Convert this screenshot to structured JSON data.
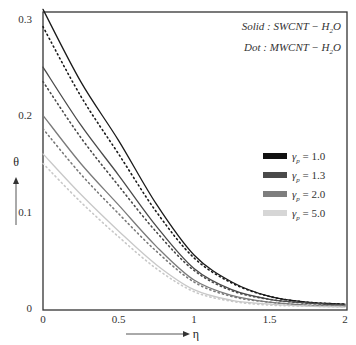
{
  "chart_data": {
    "type": "line",
    "title": "",
    "xlabel": "η",
    "ylabel": "θ",
    "xlim": [
      0,
      2
    ],
    "ylim": [
      0,
      0.31
    ],
    "xticks": [
      0,
      0.5,
      1,
      1.5,
      2
    ],
    "xtick_labels": [
      "0",
      "0.5",
      "1",
      "1.5",
      "2"
    ],
    "yticks": [
      0,
      0.1,
      0.2,
      0.3
    ],
    "ytick_labels": [
      "0",
      "0.1",
      "0.2",
      "0.3"
    ],
    "grid": false,
    "legend_position": "right-middle",
    "annotations": [
      "Solid : SWCNT − H₂O",
      "Dot : MWCNT − H₂O"
    ],
    "x": [
      0,
      0.25,
      0.5,
      0.75,
      1.0,
      1.25,
      1.5,
      1.75,
      2.0
    ],
    "series": [
      {
        "name": "γp = 1.0 (SWCNT, solid)",
        "param": "1.0",
        "style": "solid",
        "color": "#1a1a1a",
        "values": [
          0.31,
          0.235,
          0.174,
          0.108,
          0.055,
          0.027,
          0.012,
          0.006,
          0.004
        ]
      },
      {
        "name": "γp = 1.0 (MWCNT, dot)",
        "param": "1.0",
        "style": "dot",
        "color": "#1a1a1a",
        "values": [
          0.292,
          0.22,
          0.16,
          0.1,
          0.052,
          0.026,
          0.012,
          0.006,
          0.004
        ]
      },
      {
        "name": "γp = 1.3 (SWCNT, solid)",
        "param": "1.3",
        "style": "solid",
        "color": "#4a4a4a",
        "values": [
          0.25,
          0.19,
          0.138,
          0.085,
          0.041,
          0.019,
          0.009,
          0.005,
          0.003
        ]
      },
      {
        "name": "γp = 1.3 (MWCNT, dot)",
        "param": "1.3",
        "style": "dot",
        "color": "#4a4a4a",
        "values": [
          0.235,
          0.177,
          0.127,
          0.079,
          0.039,
          0.018,
          0.009,
          0.005,
          0.003
        ]
      },
      {
        "name": "γp = 2.0 (SWCNT, solid)",
        "param": "2.0",
        "style": "solid",
        "color": "#7a7a7a",
        "values": [
          0.2,
          0.15,
          0.107,
          0.064,
          0.029,
          0.013,
          0.006,
          0.003,
          0.002
        ]
      },
      {
        "name": "γp = 2.0 (MWCNT, dot)",
        "param": "2.0",
        "style": "dot",
        "color": "#7a7a7a",
        "values": [
          0.186,
          0.139,
          0.098,
          0.059,
          0.027,
          0.012,
          0.006,
          0.003,
          0.002
        ]
      },
      {
        "name": "γp = 5.0 (SWCNT, solid)",
        "param": "5.0",
        "style": "solid",
        "color": "#c8c8c8",
        "values": [
          0.16,
          0.118,
          0.08,
          0.045,
          0.019,
          0.008,
          0.004,
          0.002,
          0.001
        ]
      },
      {
        "name": "γp = 5.0 (MWCNT, dot)",
        "param": "5.0",
        "style": "dot",
        "color": "#c8c8c8",
        "values": [
          0.15,
          0.11,
          0.074,
          0.041,
          0.017,
          0.007,
          0.003,
          0.002,
          0.001
        ]
      }
    ]
  },
  "legend": {
    "items": [
      {
        "label_prefix": "γ",
        "label_sub": "p",
        "label_value": " = 1.0",
        "color": "#111111"
      },
      {
        "label_prefix": "γ",
        "label_sub": "p",
        "label_value": " = 1.3",
        "color": "#4a4a4a"
      },
      {
        "label_prefix": "γ",
        "label_sub": "p",
        "label_value": " = 2.0",
        "color": "#7e7e7e"
      },
      {
        "label_prefix": "γ",
        "label_sub": "p",
        "label_value": " = 5.0",
        "color": "#d6d6d6"
      }
    ]
  },
  "annotation": {
    "line1": "Solid : SWCNT − H",
    "line1_sub": "2",
    "line1_end": "O",
    "line2": "Dot : MWCNT − H",
    "line2_sub": "2",
    "line2_end": "O"
  },
  "axes": {
    "x_name": "η",
    "y_name": "θ"
  }
}
